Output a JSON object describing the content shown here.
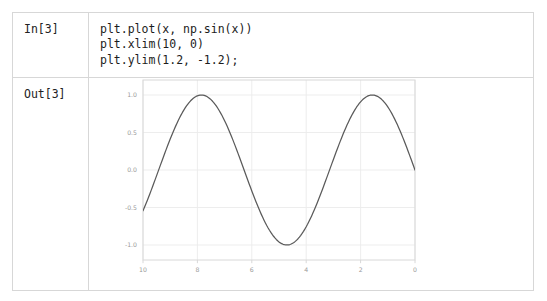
{
  "notebook": {
    "cells": [
      {
        "prompt": "In[3]",
        "type": "input",
        "code": "plt.plot(x, np.sin(x))\nplt.xlim(10, 0)\nplt.ylim(1.2, -1.2);"
      },
      {
        "prompt": "Out[3]",
        "type": "output"
      }
    ]
  },
  "chart_data": {
    "type": "line",
    "title": "",
    "xlabel": "",
    "ylabel": "",
    "xlim": [
      10,
      0
    ],
    "ylim": [
      1.2,
      -1.2
    ],
    "x_inverted": true,
    "y_inverted": true,
    "grid": true,
    "legend": null,
    "xticks": [
      10,
      8,
      6,
      4,
      2,
      0
    ],
    "xtick_labels": [
      "10",
      "8",
      "6",
      "4",
      "2",
      "0"
    ],
    "yticks": [
      -1.0,
      -0.5,
      0.0,
      0.5,
      1.0
    ],
    "ytick_labels": [
      "-1.0",
      "-0.5",
      "0.0",
      "0.5",
      "1.0"
    ],
    "line_color": "#5a5a5a",
    "grid_color": "#ebebeb",
    "frame_color": "#d8d8d8",
    "tick_label_color": "#9a9a9a",
    "series": [
      {
        "name": "np.sin(x)",
        "expression": "sin(x)",
        "x_start": 0,
        "x_end": 10,
        "samples": 200,
        "x": [
          0.0,
          0.5,
          1.0,
          1.5,
          2.0,
          2.5,
          3.0,
          3.5,
          4.0,
          4.5,
          5.0,
          5.5,
          6.0,
          6.5,
          7.0,
          7.5,
          8.0,
          8.5,
          9.0,
          9.5,
          10.0
        ],
        "y": [
          0.0,
          0.479,
          0.841,
          0.997,
          0.909,
          0.599,
          0.141,
          -0.351,
          -0.757,
          -0.978,
          -0.959,
          -0.706,
          -0.279,
          0.215,
          0.657,
          0.938,
          0.989,
          0.798,
          0.412,
          -0.075,
          -0.544
        ]
      }
    ]
  }
}
